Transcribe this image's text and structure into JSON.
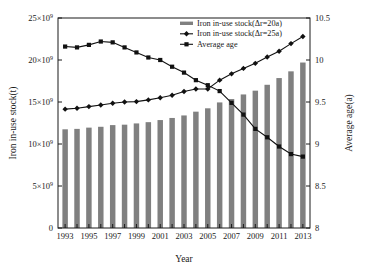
{
  "chart_data": {
    "type": "bar",
    "title": "",
    "xlabel": "Year",
    "ylabel": "Iron in-use stock(t)",
    "y2label": "Average age(a)",
    "grid": false,
    "legend_position": "top-right",
    "categories": [
      1993,
      1994,
      1995,
      1996,
      1997,
      1998,
      1999,
      2000,
      2001,
      2002,
      2003,
      2004,
      2005,
      2006,
      2007,
      2008,
      2009,
      2010,
      2011,
      2012,
      2013
    ],
    "xtick_labels": [
      "1993",
      "1995",
      "1997",
      "1999",
      "2001",
      "2003",
      "2005",
      "2007",
      "2009",
      "2011",
      "2013"
    ],
    "xlim": [
      1992.4,
      2013.6
    ],
    "ylim": [
      0,
      25000000000
    ],
    "ytick_labels": [
      "0",
      "5×10⁹",
      "10×10⁹",
      "15×10⁹",
      "20×10⁹",
      "25×10⁹"
    ],
    "ytick_values": [
      0,
      5000000000,
      10000000000,
      15000000000,
      20000000000,
      25000000000
    ],
    "y2lim": [
      8,
      10.5
    ],
    "y2tick_labels": [
      "8",
      "8.5",
      "9",
      "9.5",
      "10",
      "10.5"
    ],
    "y2tick_values": [
      8,
      8.5,
      9,
      9.5,
      10,
      10.5
    ],
    "series": [
      {
        "name": "Iron in-use stock(Δr=20a)",
        "kind": "bar",
        "axis": "left",
        "color": "#808080",
        "values": [
          11750000000.0,
          11800000000.0,
          11950000000.0,
          12050000000.0,
          12250000000.0,
          12300000000.0,
          12450000000.0,
          12600000000.0,
          12850000000.0,
          13100000000.0,
          13400000000.0,
          13850000000.0,
          14250000000.0,
          14950000000.0,
          15350000000.0,
          15900000000.0,
          16350000000.0,
          17050000000.0,
          17850000000.0,
          18650000000.0,
          19700000000.0
        ]
      },
      {
        "name": "Iron in-use stock(Δr=25a)",
        "kind": "line",
        "axis": "left",
        "color": "#111111",
        "marker": "diamond",
        "values": [
          14150000000.0,
          14250000000.0,
          14450000000.0,
          14650000000.0,
          14850000000.0,
          15000000000.0,
          15050000000.0,
          15250000000.0,
          15500000000.0,
          15800000000.0,
          16250000000.0,
          16550000000.0,
          16550000000.0,
          17600000000.0,
          18350000000.0,
          19000000000.0,
          19600000000.0,
          20350000000.0,
          21050000000.0,
          21950000000.0,
          22800000000.0
        ]
      },
      {
        "name": "Average age",
        "kind": "line",
        "axis": "right",
        "color": "#111111",
        "marker": "square",
        "values": [
          10.16,
          10.15,
          10.18,
          10.22,
          10.21,
          10.15,
          10.09,
          10.03,
          10.0,
          9.92,
          9.85,
          9.76,
          9.7,
          9.63,
          9.49,
          9.35,
          9.18,
          9.08,
          8.97,
          8.88,
          8.85
        ]
      }
    ]
  },
  "legend": {
    "items": [
      {
        "label": "Iron in-use stock(Δr=20a)",
        "marker": "bar-swatch"
      },
      {
        "label": "Iron in-use stock(Δr=25a)",
        "marker": "diamond-line"
      },
      {
        "label": "Average age",
        "marker": "square-line"
      }
    ]
  },
  "axes": {
    "x_title": "Year",
    "y_left_title": "Iron in-use stock(t)",
    "y_right_title": "Average age(a)"
  },
  "colors": {
    "bar": "#808080",
    "line": "#111111",
    "axis": "#1a1a1a",
    "background": "#ffffff"
  }
}
